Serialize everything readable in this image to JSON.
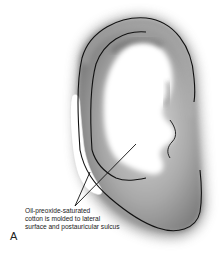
{
  "figure": {
    "panel_label": "A",
    "annotation": {
      "lines": [
        "Oil-preoxide-saturated",
        "cotton is molded to lateral",
        "surface and postauricular sulcus"
      ]
    },
    "colors": {
      "background": "#ffffff",
      "ear_shade": "#9a9a9a",
      "outline": "#111111",
      "cotton": "#ffffff"
    }
  }
}
